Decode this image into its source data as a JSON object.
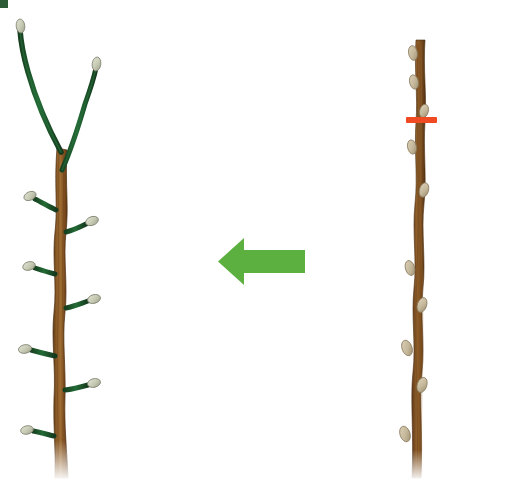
{
  "figure": {
    "background_color": "#ffffff",
    "width": 523,
    "height": 481
  },
  "colors": {
    "bark_brown": "#7d4f20",
    "bark_brown_dark": "#5e3a16",
    "bark_brown_light": "#9a6a33",
    "shoot_green": "#1f5c33",
    "shoot_green_dark": "#16401f",
    "bud_pale": "#cfd2bd",
    "bud_pale_edge": "#8d8f7c",
    "dormant_bud": "#cbbfa4",
    "dormant_bud_edge": "#8d7f62",
    "arrow_green": "#5cb040",
    "cut_mark_red": "#f04a22",
    "corner_artifact_green": "#2d5c36"
  },
  "panels": {
    "left": {
      "name": "regrown-branch",
      "label": "Pruned branch with new green shoots",
      "trunk_color": "#7d4f20",
      "shoot_color": "#1f5c33",
      "bud_color": "#cfd2bd",
      "lateral_shoot_count": 6,
      "leader_shoot_count": 2
    },
    "right": {
      "name": "dormant-branch",
      "label": "Dormant branch before pruning",
      "trunk_color": "#7d4f20",
      "bud_color": "#cbbfa4",
      "bud_count": 9,
      "cut_mark": {
        "name": "pruning-cut-mark",
        "color": "#f04a22",
        "x": 406,
        "y": 117,
        "width": 31,
        "height": 6
      }
    }
  },
  "arrow": {
    "name": "transformation-arrow",
    "direction": "left",
    "color": "#5cb040",
    "shaft": {
      "x": 240,
      "y": 250,
      "width": 65,
      "height": 11
    },
    "head_tip_x": 218,
    "head_y": 256
  },
  "artifact": {
    "name": "corner-pixel-artifact",
    "color": "#2d5c36",
    "x": 0,
    "y": 0,
    "width": 8,
    "height": 8
  },
  "chart_data": {
    "type": "diagram",
    "annotations": [
      "Red horizontal mark indicates the pruning cut position on the dormant branch",
      "Green left-pointing arrow indicates progression from dormant branch to regrown branch"
    ],
    "elements": [
      {
        "name": "dormant-branch",
        "side": "right",
        "buds": 9,
        "cut_mark": true
      },
      {
        "name": "regrown-branch",
        "side": "left",
        "lateral_shoots": 6,
        "leader_shoots": 2
      }
    ]
  }
}
